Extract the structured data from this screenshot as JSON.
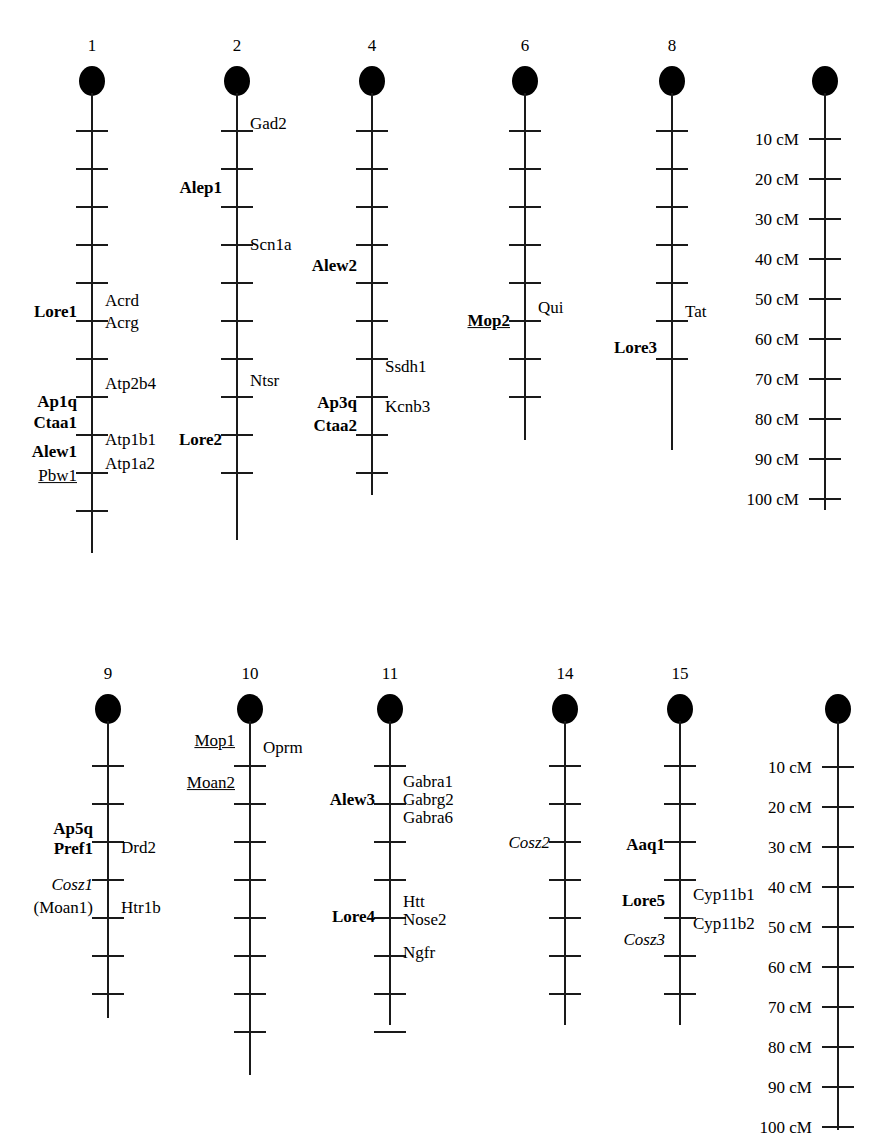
{
  "figure": {
    "kind": "genetic-linkage-map",
    "scale_unit": "cM"
  },
  "scale": {
    "labels": [
      "10 cM",
      "20 cM",
      "30 cM",
      "40 cM",
      "50 cM",
      "60 cM",
      "70 cM",
      "80 cM",
      "90 cM",
      "100 cM"
    ],
    "values": [
      10,
      20,
      30,
      40,
      50,
      60,
      70,
      80,
      90,
      100
    ],
    "interval": 10
  },
  "rows": [
    {
      "name": "top-row",
      "chromosomes": [
        {
          "number": "1",
          "cx": 92,
          "top": 66,
          "ticks": 11,
          "tick_start": 130,
          "tick_step": 38,
          "axis_end": 553,
          "left_labels": [
            {
              "text": "Lore1",
              "y": 312,
              "style": "bold"
            },
            {
              "text": "Ap1q",
              "y": 402,
              "style": "bold"
            },
            {
              "text": "Ctaa1",
              "y": 423,
              "style": "bold"
            },
            {
              "text": "Alew1",
              "y": 452,
              "style": "bold"
            },
            {
              "text": "Pbw1",
              "y": 476,
              "style": "underline"
            }
          ],
          "right_labels": [
            {
              "text": "Acrd",
              "y": 301,
              "style": "normal"
            },
            {
              "text": "Acrg",
              "y": 323,
              "style": "normal"
            },
            {
              "text": "Atp2b4",
              "y": 384,
              "style": "normal"
            },
            {
              "text": "Atp1b1",
              "y": 440,
              "style": "normal"
            },
            {
              "text": "Atp1a2",
              "y": 464,
              "style": "normal"
            }
          ]
        },
        {
          "number": "2",
          "cx": 237,
          "top": 66,
          "ticks": 10,
          "tick_start": 130,
          "tick_step": 38,
          "axis_end": 540,
          "left_labels": [
            {
              "text": "Alep1",
              "y": 188,
              "style": "bold"
            },
            {
              "text": "Lore2",
              "y": 440,
              "style": "bold"
            }
          ],
          "right_labels": [
            {
              "text": "Gad2",
              "y": 124,
              "style": "normal"
            },
            {
              "text": "Scn1a",
              "y": 245,
              "style": "normal"
            },
            {
              "text": "Ntsr",
              "y": 381,
              "style": "normal"
            }
          ]
        },
        {
          "number": "4",
          "cx": 372,
          "top": 66,
          "ticks": 10,
          "tick_start": 130,
          "tick_step": 38,
          "axis_end": 495,
          "left_labels": [
            {
              "text": "Alew2",
              "y": 266,
              "style": "bold"
            },
            {
              "text": "Ap3q",
              "y": 403,
              "style": "bold"
            },
            {
              "text": "Ctaa2",
              "y": 426,
              "style": "bold"
            }
          ],
          "right_labels": [
            {
              "text": "Ssdh1",
              "y": 367,
              "style": "normal"
            },
            {
              "text": "Kcnb3",
              "y": 407,
              "style": "normal"
            }
          ]
        },
        {
          "number": "6",
          "cx": 525,
          "top": 66,
          "ticks": 8,
          "tick_start": 130,
          "tick_step": 38,
          "axis_end": 440,
          "left_labels": [
            {
              "text": "Mop2",
              "y": 321,
              "style": "bold-underline"
            }
          ],
          "right_labels": [
            {
              "text": "Qui",
              "y": 308,
              "style": "normal"
            }
          ]
        },
        {
          "number": "8",
          "cx": 672,
          "top": 66,
          "ticks": 7,
          "tick_start": 130,
          "tick_step": 38,
          "axis_end": 450,
          "left_labels": [
            {
              "text": "Lore3",
              "y": 348,
              "style": "bold"
            }
          ],
          "right_labels": [
            {
              "text": "Tat",
              "y": 312,
              "style": "normal"
            }
          ]
        },
        {
          "number": "",
          "is_scale": true,
          "cx": 825,
          "top": 66,
          "ticks": 10,
          "tick_start": 138,
          "tick_step": 40,
          "axis_end": 510,
          "left_labels": [],
          "right_labels": []
        }
      ]
    },
    {
      "name": "bottom-row",
      "chromosomes": [
        {
          "number": "9",
          "cx": 108,
          "top": 694,
          "ticks": 7,
          "tick_start": 765,
          "tick_step": 38,
          "axis_end": 1018,
          "left_labels": [
            {
              "text": "Ap5q",
              "y": 829,
              "style": "bold"
            },
            {
              "text": "Pref1",
              "y": 849,
              "style": "bold"
            },
            {
              "text": "Cosz1",
              "y": 885,
              "style": "italic"
            },
            {
              "text": "(Moan1)",
              "y": 908,
              "style": "normal"
            }
          ],
          "right_labels": [
            {
              "text": "Drd2",
              "y": 848,
              "style": "normal"
            },
            {
              "text": "Htr1b",
              "y": 908,
              "style": "normal"
            }
          ]
        },
        {
          "number": "10",
          "cx": 250,
          "top": 694,
          "ticks": 8,
          "tick_start": 765,
          "tick_step": 38,
          "axis_end": 1075,
          "left_labels": [
            {
              "text": "Mop1",
              "y": 741,
              "style": "underline"
            },
            {
              "text": "Moan2",
              "y": 783,
              "style": "underline"
            }
          ],
          "right_labels": [
            {
              "text": "Oprm",
              "y": 748,
              "style": "normal"
            }
          ]
        },
        {
          "number": "11",
          "cx": 390,
          "top": 694,
          "ticks": 8,
          "tick_start": 765,
          "tick_step": 38,
          "axis_end": 1025,
          "left_labels": [
            {
              "text": "Alew3",
              "y": 800,
              "style": "bold"
            },
            {
              "text": "Lore4",
              "y": 917,
              "style": "bold"
            }
          ],
          "right_labels": [
            {
              "lines": [
                "Gabra1",
                "Gabrg2",
                "Gabra6"
              ],
              "y": 800,
              "style": "normal"
            },
            {
              "lines": [
                "Htt",
                "Nose2"
              ],
              "y": 911,
              "style": "normal"
            },
            {
              "text": "Ngfr",
              "y": 953,
              "style": "normal"
            }
          ]
        },
        {
          "number": "14",
          "cx": 565,
          "top": 694,
          "ticks": 7,
          "tick_start": 765,
          "tick_step": 38,
          "axis_end": 1025,
          "left_labels": [
            {
              "text": "Cosz2",
              "y": 843,
              "style": "italic"
            }
          ],
          "right_labels": []
        },
        {
          "number": "15",
          "cx": 680,
          "top": 694,
          "ticks": 7,
          "tick_start": 765,
          "tick_step": 38,
          "axis_end": 1025,
          "left_labels": [
            {
              "text": "Aaq1",
              "y": 845,
              "style": "bold"
            },
            {
              "text": "Lore5",
              "y": 901,
              "style": "bold"
            },
            {
              "text": "Cosz3",
              "y": 940,
              "style": "italic"
            }
          ],
          "right_labels": [
            {
              "text": "Cyp11b1",
              "y": 895,
              "style": "normal"
            },
            {
              "text": "Cyp11b2",
              "y": 924,
              "style": "normal"
            }
          ]
        },
        {
          "number": "",
          "is_scale": true,
          "cx": 838,
          "top": 694,
          "ticks": 10,
          "tick_start": 766,
          "tick_step": 40,
          "axis_end": 1130,
          "left_labels": [],
          "right_labels": []
        }
      ]
    }
  ]
}
